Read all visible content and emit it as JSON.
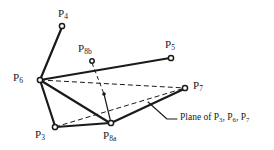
{
  "figure": {
    "type": "line-diagram",
    "background_color": "#ffffff",
    "stroke_color": "#1a1a1a",
    "width": 274,
    "height": 150
  },
  "nodes": [
    {
      "id": "P4",
      "label": "P",
      "sub": "4",
      "marker": "open-circle",
      "x": 62,
      "y": 26,
      "label_x": 58,
      "label_y": 8
    },
    {
      "id": "P8b",
      "label": "P",
      "sub": "8b",
      "marker": "open-circle",
      "x": 92,
      "y": 61,
      "label_x": 78,
      "label_y": 43
    },
    {
      "id": "P5",
      "label": "P",
      "sub": "5",
      "marker": "open-circle",
      "x": 171,
      "y": 58,
      "label_x": 165,
      "label_y": 39
    },
    {
      "id": "P6",
      "label": "P",
      "sub": "6",
      "marker": "open-circle",
      "x": 40,
      "y": 80,
      "label_x": 13,
      "label_y": 72
    },
    {
      "id": "P7",
      "label": "P",
      "sub": "7",
      "marker": "open-circle",
      "x": 185,
      "y": 88,
      "label_x": 193,
      "label_y": 80
    },
    {
      "id": "P3",
      "label": "P",
      "sub": "3",
      "marker": "open-circle",
      "x": 55,
      "y": 127,
      "label_x": 35,
      "label_y": 129
    },
    {
      "id": "P8a",
      "label": "P",
      "sub": "8a",
      "marker": "open-circle",
      "x": 111,
      "y": 123,
      "label_x": 103,
      "label_y": 130
    },
    {
      "id": "Pm",
      "label": "",
      "sub": "",
      "marker": "filled-dot",
      "x": 104,
      "y": 94,
      "label_x": 0,
      "label_y": 0
    }
  ],
  "edges": [
    {
      "from": "P6",
      "to": "P4",
      "style": "solid",
      "weight": 2.1
    },
    {
      "from": "P6",
      "to": "P5",
      "style": "solid",
      "weight": 2.1
    },
    {
      "from": "P6",
      "to": "P3",
      "style": "solid",
      "weight": 2.1
    },
    {
      "from": "P6",
      "to": "P8a",
      "style": "solid",
      "weight": 2.1
    },
    {
      "from": "P3",
      "to": "P8a",
      "style": "solid",
      "weight": 2.1
    },
    {
      "from": "P8a",
      "to": "P7",
      "style": "solid",
      "weight": 2.1
    },
    {
      "from": "Pm",
      "to": "P8a",
      "style": "solid",
      "weight": 1.1
    },
    {
      "from": "P8b",
      "to": "Pm",
      "style": "dashed",
      "weight": 1.0
    },
    {
      "from": "P6",
      "to": "P7",
      "style": "dashed",
      "weight": 1.0
    },
    {
      "from": "P3",
      "to": "P7",
      "style": "dashed",
      "weight": 1.0
    }
  ],
  "annotation": {
    "id": "plane-callout",
    "text_prefix": "Plane of P",
    "sub1": "3",
    "mid1": ", P",
    "sub2": "6",
    "mid2": ", P",
    "sub3": "7",
    "full_text": "Plane of P3, P6, P7",
    "text_x": 176,
    "text_y": 113,
    "leader": {
      "x1": 148,
      "y1": 102,
      "x2": 167,
      "y2": 119,
      "x3": 176,
      "y3": 119
    }
  }
}
